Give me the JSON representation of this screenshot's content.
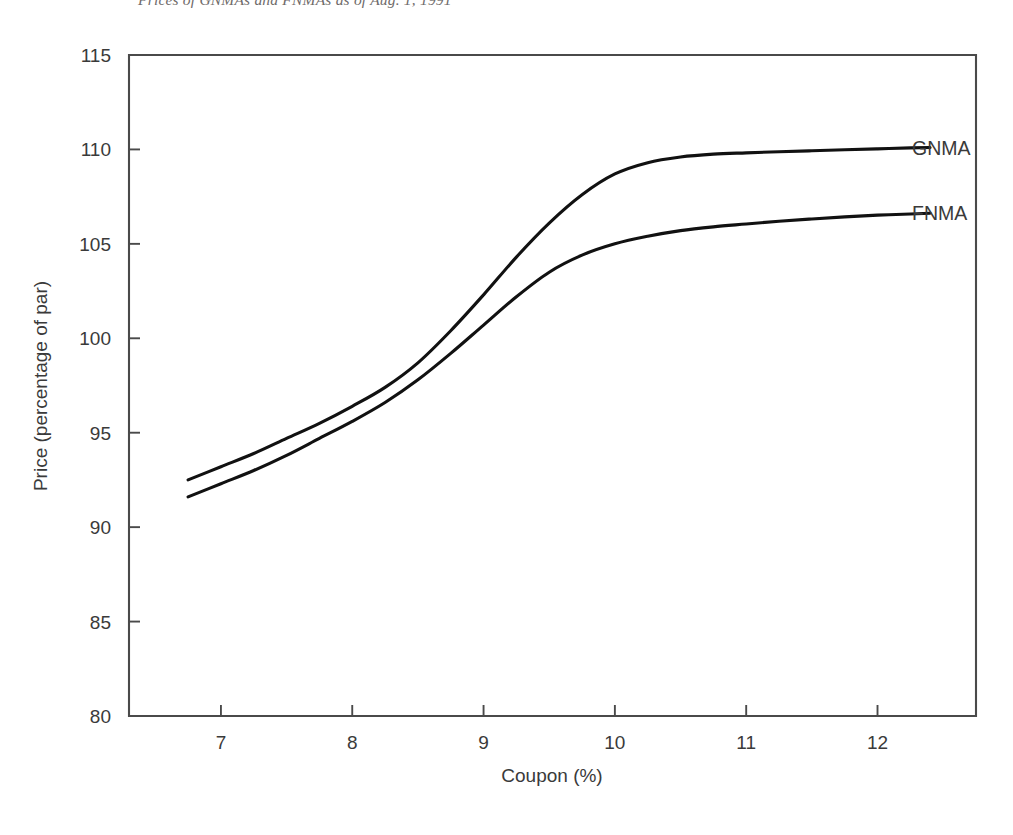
{
  "caption": {
    "text": "Prices of GNMAs and FNMAs as of Aug. 1, 1991"
  },
  "chart_data": {
    "type": "line",
    "title": "",
    "xlabel": "Coupon (%)",
    "ylabel": "Price (percentage of par)",
    "xlim": [
      6.3,
      12.75
    ],
    "ylim": [
      80,
      115
    ],
    "xticks": [
      "7",
      "8",
      "9",
      "10",
      "11",
      "12"
    ],
    "xtick_values": [
      7,
      8,
      9,
      10,
      11,
      12
    ],
    "yticks": [
      "80",
      "85",
      "90",
      "95",
      "100",
      "105",
      "110",
      "115"
    ],
    "ytick_values": [
      80,
      85,
      90,
      95,
      100,
      105,
      110,
      115
    ],
    "grid": false,
    "legend_position": "right-of-axes-inline",
    "series": [
      {
        "name": "GNMA",
        "label": "GNMA",
        "color": "#111111",
        "x": [
          6.75,
          7.0,
          7.25,
          7.5,
          7.75,
          8.0,
          8.25,
          8.5,
          8.75,
          9.0,
          9.25,
          9.5,
          9.75,
          10.0,
          10.25,
          10.5,
          10.75,
          11.0,
          11.25,
          11.5,
          11.75,
          12.0,
          12.25,
          12.4
        ],
        "y": [
          92.5,
          93.2,
          93.9,
          94.7,
          95.5,
          96.4,
          97.4,
          98.7,
          100.4,
          102.3,
          104.3,
          106.1,
          107.6,
          108.7,
          109.3,
          109.6,
          109.75,
          109.82,
          109.88,
          109.93,
          109.98,
          110.03,
          110.08,
          110.1
        ]
      },
      {
        "name": "FNMA",
        "label": "FNMA",
        "color": "#111111",
        "x": [
          6.75,
          7.0,
          7.25,
          7.5,
          7.75,
          8.0,
          8.25,
          8.5,
          8.75,
          9.0,
          9.25,
          9.5,
          9.75,
          10.0,
          10.25,
          10.5,
          10.75,
          11.0,
          11.25,
          11.5,
          11.75,
          12.0,
          12.25,
          12.4
        ],
        "y": [
          91.6,
          92.3,
          93.0,
          93.8,
          94.7,
          95.6,
          96.6,
          97.8,
          99.2,
          100.7,
          102.2,
          103.5,
          104.4,
          105.0,
          105.4,
          105.7,
          105.9,
          106.05,
          106.2,
          106.32,
          106.43,
          106.52,
          106.58,
          106.62
        ]
      }
    ]
  },
  "axes_geometry": {
    "plot_left": 129,
    "plot_right": 976,
    "plot_top": 55,
    "plot_bottom": 716,
    "label_anchor_x": 912
  }
}
